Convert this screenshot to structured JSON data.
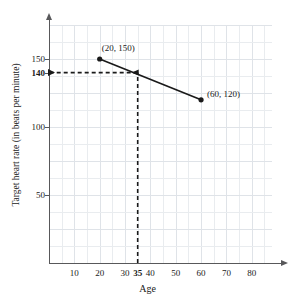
{
  "chart_data": {
    "type": "line",
    "title": "",
    "xlabel": "Age",
    "ylabel": "Target heart rate (in beats per minute)",
    "xlim": [
      0,
      88
    ],
    "ylim": [
      0,
      175
    ],
    "grid": true,
    "legend": "none",
    "series": [
      {
        "name": "Target heart rate",
        "x": [
          20,
          60
        ],
        "y": [
          150,
          120
        ],
        "point_labels": [
          "(20, 150)",
          "(60, 120)"
        ]
      }
    ],
    "xticks": [
      {
        "value": 10,
        "label": "10",
        "bold": false
      },
      {
        "value": 20,
        "label": "20",
        "bold": false
      },
      {
        "value": 30,
        "label": "30",
        "bold": false
      },
      {
        "value": 35,
        "label": "35",
        "bold": true
      },
      {
        "value": 40,
        "label": "40",
        "bold": false
      },
      {
        "value": 50,
        "label": "50",
        "bold": false
      },
      {
        "value": 60,
        "label": "60",
        "bold": false
      },
      {
        "value": 70,
        "label": "70",
        "bold": false
      },
      {
        "value": 80,
        "label": "80",
        "bold": false
      }
    ],
    "yticks": [
      {
        "value": 150,
        "label": "150",
        "bold": false
      },
      {
        "value": 140,
        "label": "140",
        "bold": true
      },
      {
        "value": 100,
        "label": "100",
        "bold": false
      },
      {
        "value": 50,
        "label": "50",
        "bold": false
      }
    ],
    "annotations": [
      {
        "name": "vertical-guide",
        "kind": "dashed-arrow",
        "from": {
          "x": 35,
          "y": 0
        },
        "to": {
          "x": 35,
          "y": 140
        },
        "label": "35"
      },
      {
        "name": "horizontal-guide",
        "kind": "dashed-arrow",
        "from": {
          "x": 35,
          "y": 140
        },
        "to": {
          "x": 0,
          "y": 140
        },
        "label": "140"
      }
    ],
    "colors": {
      "line": "#1a1a1a",
      "axis": "#58585a",
      "grid": "#e9ecef",
      "guide": "#1a1a1a",
      "background": "#ffffff"
    }
  }
}
